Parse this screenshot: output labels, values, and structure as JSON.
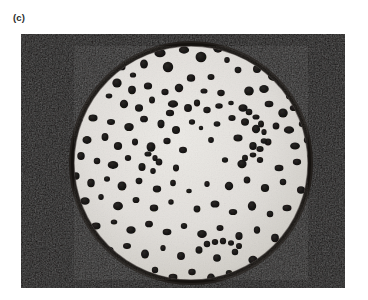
{
  "figure": {
    "panel_label": "(c)",
    "caption_text": "",
    "media_type": "black-and-white photograph"
  },
  "photo": {
    "alt_text": "Black and white photograph of a circular petri dish culture plate with numerous dark bacterial colonies scattered across a pale agar surface",
    "frame": {
      "x": 21,
      "y": 34,
      "width": 324,
      "height": 254
    },
    "colors": {
      "page_background": "#ffffff",
      "photo_background": "#0d0b0a",
      "dish_rim": "#15120f",
      "agar_light": "#e6e4e0",
      "agar_mid": "#d8d5d0",
      "agar_shadow": "#bfbcb6",
      "colony_dark": "#171514",
      "colony_edge": "#3a3633",
      "label_color": "#2b2b2b"
    },
    "dish": {
      "center_x": 170,
      "center_y": 129,
      "radius": 121,
      "rim_width": 4
    },
    "colonies": [
      {
        "cx": 139,
        "cy": 19,
        "r": 5.2
      },
      {
        "cx": 163,
        "cy": 16,
        "r": 4.6
      },
      {
        "cx": 180,
        "cy": 23,
        "r": 5.6
      },
      {
        "cx": 197,
        "cy": 14,
        "r": 5.0
      },
      {
        "cx": 206,
        "cy": 26,
        "r": 3.0
      },
      {
        "cx": 123,
        "cy": 30,
        "r": 4.4
      },
      {
        "cx": 147,
        "cy": 33,
        "r": 5.4
      },
      {
        "cx": 101,
        "cy": 33,
        "r": 3.6
      },
      {
        "cx": 112,
        "cy": 41,
        "r": 3.0
      },
      {
        "cx": 170,
        "cy": 44,
        "r": 4.2
      },
      {
        "cx": 190,
        "cy": 43,
        "r": 3.4
      },
      {
        "cx": 217,
        "cy": 36,
        "r": 3.4
      },
      {
        "cx": 236,
        "cy": 35,
        "r": 4.2
      },
      {
        "cx": 253,
        "cy": 42,
        "r": 5.8
      },
      {
        "cx": 261,
        "cy": 49,
        "r": 4.6
      },
      {
        "cx": 96,
        "cy": 49,
        "r": 4.8
      },
      {
        "cx": 111,
        "cy": 56,
        "r": 4.2
      },
      {
        "cx": 127,
        "cy": 52,
        "r": 4.0
      },
      {
        "cx": 144,
        "cy": 58,
        "r": 3.6
      },
      {
        "cx": 158,
        "cy": 54,
        "r": 4.4
      },
      {
        "cx": 183,
        "cy": 57,
        "r": 3.2
      },
      {
        "cx": 200,
        "cy": 59,
        "r": 3.6
      },
      {
        "cx": 228,
        "cy": 57,
        "r": 4.8
      },
      {
        "cx": 243,
        "cy": 55,
        "r": 4.6
      },
      {
        "cx": 269,
        "cy": 62,
        "r": 4.0
      },
      {
        "cx": 88,
        "cy": 62,
        "r": 3.0
      },
      {
        "cx": 103,
        "cy": 70,
        "r": 4.4
      },
      {
        "cx": 118,
        "cy": 74,
        "r": 4.0
      },
      {
        "cx": 131,
        "cy": 66,
        "r": 3.4
      },
      {
        "cx": 152,
        "cy": 70,
        "r": 4.6
      },
      {
        "cx": 149,
        "cy": 79,
        "r": 3.8
      },
      {
        "cx": 167,
        "cy": 74,
        "r": 4.2
      },
      {
        "cx": 176,
        "cy": 69,
        "r": 3.4
      },
      {
        "cx": 186,
        "cy": 76,
        "r": 3.6
      },
      {
        "cx": 198,
        "cy": 72,
        "r": 3.4
      },
      {
        "cx": 210,
        "cy": 69,
        "r": 2.6
      },
      {
        "cx": 222,
        "cy": 74,
        "r": 4.4
      },
      {
        "cx": 248,
        "cy": 70,
        "r": 4.0
      },
      {
        "cx": 262,
        "cy": 79,
        "r": 4.8
      },
      {
        "cx": 273,
        "cy": 74,
        "r": 3.8
      },
      {
        "cx": 58,
        "cy": 86,
        "r": 3.2
      },
      {
        "cx": 72,
        "cy": 84,
        "r": 4.2
      },
      {
        "cx": 90,
        "cy": 88,
        "r": 3.6
      },
      {
        "cx": 108,
        "cy": 93,
        "r": 4.6
      },
      {
        "cx": 123,
        "cy": 85,
        "r": 3.8
      },
      {
        "cx": 140,
        "cy": 90,
        "r": 4.0
      },
      {
        "cx": 155,
        "cy": 96,
        "r": 4.2
      },
      {
        "cx": 171,
        "cy": 88,
        "r": 3.0
      },
      {
        "cx": 180,
        "cy": 94,
        "r": 2.4
      },
      {
        "cx": 196,
        "cy": 90,
        "r": 3.2
      },
      {
        "cx": 211,
        "cy": 84,
        "r": 3.4
      },
      {
        "cx": 224,
        "cy": 88,
        "r": 4.0
      },
      {
        "cx": 235,
        "cy": 95,
        "r": 4.4
      },
      {
        "cx": 255,
        "cy": 92,
        "r": 3.6
      },
      {
        "cx": 268,
        "cy": 96,
        "r": 4.6
      },
      {
        "cx": 281,
        "cy": 90,
        "r": 3.2
      },
      {
        "cx": 53,
        "cy": 100,
        "r": 3.0
      },
      {
        "cx": 66,
        "cy": 106,
        "r": 4.4
      },
      {
        "cx": 84,
        "cy": 103,
        "r": 3.8
      },
      {
        "cx": 97,
        "cy": 112,
        "r": 4.2
      },
      {
        "cx": 114,
        "cy": 108,
        "r": 3.4
      },
      {
        "cx": 130,
        "cy": 113,
        "r": 4.8
      },
      {
        "cx": 146,
        "cy": 107,
        "r": 3.6
      },
      {
        "cx": 162,
        "cy": 116,
        "r": 3.8
      },
      {
        "cx": 190,
        "cy": 106,
        "r": 3.0
      },
      {
        "cx": 217,
        "cy": 104,
        "r": 4.2
      },
      {
        "cx": 232,
        "cy": 112,
        "r": 4.0
      },
      {
        "cx": 247,
        "cy": 108,
        "r": 3.6
      },
      {
        "cx": 274,
        "cy": 112,
        "r": 4.4
      },
      {
        "cx": 286,
        "cy": 106,
        "r": 3.4
      },
      {
        "cx": 60,
        "cy": 122,
        "r": 4.0
      },
      {
        "cx": 76,
        "cy": 127,
        "r": 3.4
      },
      {
        "cx": 92,
        "cy": 131,
        "r": 4.8
      },
      {
        "cx": 107,
        "cy": 124,
        "r": 3.2
      },
      {
        "cx": 121,
        "cy": 133,
        "r": 4.0
      },
      {
        "cx": 138,
        "cy": 128,
        "r": 3.6
      },
      {
        "cx": 132,
        "cy": 137,
        "r": 3.0
      },
      {
        "cx": 155,
        "cy": 134,
        "r": 3.4
      },
      {
        "cx": 204,
        "cy": 126,
        "r": 3.0
      },
      {
        "cx": 221,
        "cy": 130,
        "r": 4.6
      },
      {
        "cx": 239,
        "cy": 126,
        "r": 3.2
      },
      {
        "cx": 258,
        "cy": 134,
        "r": 4.0
      },
      {
        "cx": 276,
        "cy": 128,
        "r": 3.8
      },
      {
        "cx": 290,
        "cy": 122,
        "r": 3.4
      },
      {
        "cx": 55,
        "cy": 142,
        "r": 3.8
      },
      {
        "cx": 70,
        "cy": 149,
        "r": 4.2
      },
      {
        "cx": 86,
        "cy": 145,
        "r": 3.0
      },
      {
        "cx": 101,
        "cy": 152,
        "r": 4.6
      },
      {
        "cx": 118,
        "cy": 147,
        "r": 3.4
      },
      {
        "cx": 136,
        "cy": 155,
        "r": 4.0
      },
      {
        "cx": 152,
        "cy": 149,
        "r": 3.2
      },
      {
        "cx": 168,
        "cy": 157,
        "r": 2.6
      },
      {
        "cx": 186,
        "cy": 150,
        "r": 3.0
      },
      {
        "cx": 208,
        "cy": 152,
        "r": 4.4
      },
      {
        "cx": 226,
        "cy": 146,
        "r": 3.6
      },
      {
        "cx": 244,
        "cy": 154,
        "r": 4.2
      },
      {
        "cx": 262,
        "cy": 148,
        "r": 3.4
      },
      {
        "cx": 280,
        "cy": 156,
        "r": 4.0
      },
      {
        "cx": 48,
        "cy": 160,
        "r": 3.2
      },
      {
        "cx": 64,
        "cy": 167,
        "r": 4.4
      },
      {
        "cx": 80,
        "cy": 163,
        "r": 3.0
      },
      {
        "cx": 97,
        "cy": 172,
        "r": 4.8
      },
      {
        "cx": 115,
        "cy": 166,
        "r": 3.4
      },
      {
        "cx": 133,
        "cy": 174,
        "r": 4.0
      },
      {
        "cx": 150,
        "cy": 168,
        "r": 2.8
      },
      {
        "cx": 176,
        "cy": 175,
        "r": 3.6
      },
      {
        "cx": 194,
        "cy": 170,
        "r": 4.2
      },
      {
        "cx": 212,
        "cy": 178,
        "r": 3.8
      },
      {
        "cx": 231,
        "cy": 172,
        "r": 4.6
      },
      {
        "cx": 249,
        "cy": 180,
        "r": 3.4
      },
      {
        "cx": 266,
        "cy": 174,
        "r": 4.0
      },
      {
        "cx": 58,
        "cy": 186,
        "r": 3.6
      },
      {
        "cx": 75,
        "cy": 192,
        "r": 4.2
      },
      {
        "cx": 93,
        "cy": 188,
        "r": 3.0
      },
      {
        "cx": 110,
        "cy": 196,
        "r": 4.4
      },
      {
        "cx": 128,
        "cy": 190,
        "r": 3.8
      },
      {
        "cx": 146,
        "cy": 198,
        "r": 4.0
      },
      {
        "cx": 163,
        "cy": 192,
        "r": 3.2
      },
      {
        "cx": 181,
        "cy": 200,
        "r": 4.6
      },
      {
        "cx": 199,
        "cy": 194,
        "r": 3.4
      },
      {
        "cx": 218,
        "cy": 202,
        "r": 4.0
      },
      {
        "cx": 236,
        "cy": 196,
        "r": 3.6
      },
      {
        "cx": 254,
        "cy": 204,
        "r": 4.2
      },
      {
        "cx": 70,
        "cy": 210,
        "r": 3.4
      },
      {
        "cx": 88,
        "cy": 216,
        "r": 4.0
      },
      {
        "cx": 106,
        "cy": 212,
        "r": 3.6
      },
      {
        "cx": 124,
        "cy": 220,
        "r": 4.4
      },
      {
        "cx": 142,
        "cy": 214,
        "r": 3.0
      },
      {
        "cx": 160,
        "cy": 222,
        "r": 4.2
      },
      {
        "cx": 178,
        "cy": 216,
        "r": 3.8
      },
      {
        "cx": 196,
        "cy": 224,
        "r": 4.0
      },
      {
        "cx": 214,
        "cy": 218,
        "r": 3.4
      },
      {
        "cx": 232,
        "cy": 226,
        "r": 4.6
      },
      {
        "cx": 96,
        "cy": 234,
        "r": 3.8
      },
      {
        "cx": 115,
        "cy": 240,
        "r": 4.2
      },
      {
        "cx": 134,
        "cy": 236,
        "r": 3.4
      },
      {
        "cx": 152,
        "cy": 243,
        "r": 4.0
      },
      {
        "cx": 171,
        "cy": 238,
        "r": 3.6
      },
      {
        "cx": 190,
        "cy": 244,
        "r": 4.4
      },
      {
        "cx": 208,
        "cy": 239,
        "r": 3.2
      },
      {
        "cx": 130,
        "cy": 252,
        "r": 3.6
      },
      {
        "cx": 150,
        "cy": 249,
        "r": 3.0
      },
      {
        "cx": 168,
        "cy": 253,
        "r": 4.0
      }
    ],
    "colony_chains": [
      {
        "name": "upper-right-arc",
        "points": [
          {
            "cx": 228,
            "cy": 78,
            "r": 3.4
          },
          {
            "cx": 235,
            "cy": 83,
            "r": 3.2
          },
          {
            "cx": 240,
            "cy": 90,
            "r": 3.4
          },
          {
            "cx": 243,
            "cy": 98,
            "r": 3.0
          },
          {
            "cx": 243,
            "cy": 107,
            "r": 3.2
          },
          {
            "cx": 239,
            "cy": 115,
            "r": 3.4
          },
          {
            "cx": 232,
            "cy": 121,
            "r": 3.0
          },
          {
            "cx": 224,
            "cy": 124,
            "r": 3.2
          }
        ]
      },
      {
        "name": "lower-center-chain",
        "points": [
          {
            "cx": 186,
            "cy": 210,
            "r": 3.4
          },
          {
            "cx": 194,
            "cy": 208,
            "r": 3.2
          },
          {
            "cx": 202,
            "cy": 207,
            "r": 3.4
          },
          {
            "cx": 210,
            "cy": 209,
            "r": 3.0
          },
          {
            "cx": 218,
            "cy": 212,
            "r": 3.2
          }
        ]
      },
      {
        "name": "lower-right-chain",
        "points": [
          {
            "cx": 204,
            "cy": 246,
            "r": 3.4
          },
          {
            "cx": 213,
            "cy": 243,
            "r": 3.2
          },
          {
            "cx": 222,
            "cy": 241,
            "r": 3.4
          },
          {
            "cx": 231,
            "cy": 240,
            "r": 3.0
          }
        ]
      },
      {
        "name": "mid-left-pair",
        "points": [
          {
            "cx": 127,
            "cy": 120,
            "r": 3.2
          },
          {
            "cx": 134,
            "cy": 124,
            "r": 3.0
          }
        ]
      }
    ]
  }
}
